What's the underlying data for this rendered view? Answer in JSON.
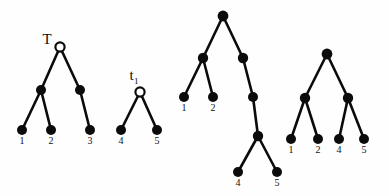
{
  "figure": {
    "background_color": "#fefefe",
    "stroke_color": "#0b0b0b",
    "width": 389,
    "height": 196
  },
  "trees": [
    {
      "id": "tree-T",
      "name": "T",
      "name_subscript": "",
      "name_x": 47,
      "name_y": 44,
      "root_style": "hollow",
      "nodes": [
        {
          "id": "T-root",
          "x": 60,
          "y": 47,
          "style": "hollow",
          "r": 4.6
        },
        {
          "id": "T-int-l",
          "x": 41,
          "y": 90,
          "style": "filled",
          "r": 5.0
        },
        {
          "id": "T-int-r",
          "x": 80,
          "y": 90,
          "style": "filled",
          "r": 5.0
        },
        {
          "id": "T-leaf-1",
          "x": 22,
          "y": 130,
          "style": "filled",
          "r": 5.0
        },
        {
          "id": "T-leaf-2",
          "x": 51,
          "y": 130,
          "style": "filled",
          "r": 5.0
        },
        {
          "id": "T-leaf-3",
          "x": 90,
          "y": 130,
          "style": "filled",
          "r": 5.0
        }
      ],
      "edges": [
        {
          "from": "T-root",
          "to": "T-int-l"
        },
        {
          "from": "T-root",
          "to": "T-int-r"
        },
        {
          "from": "T-int-l",
          "to": "T-leaf-1"
        },
        {
          "from": "T-int-l",
          "to": "T-leaf-2"
        },
        {
          "from": "T-int-r",
          "to": "T-leaf-3"
        }
      ],
      "leaf_labels": [
        {
          "text": "1",
          "x": 22,
          "y": 144
        },
        {
          "text": "2",
          "x": 51,
          "y": 144
        },
        {
          "text": "3",
          "x": 90,
          "y": 144
        }
      ]
    },
    {
      "id": "tree-t1",
      "name": "t",
      "name_subscript": "1",
      "name_x": 134,
      "name_y": 80,
      "root_style": "hollow",
      "nodes": [
        {
          "id": "t1-root",
          "x": 140,
          "y": 92,
          "style": "hollow",
          "r": 4.6
        },
        {
          "id": "t1-leaf-4",
          "x": 121,
          "y": 130,
          "style": "filled",
          "r": 5.0
        },
        {
          "id": "t1-leaf-5",
          "x": 157,
          "y": 130,
          "style": "filled",
          "r": 5.0
        }
      ],
      "edges": [
        {
          "from": "t1-root",
          "to": "t1-leaf-4"
        },
        {
          "from": "t1-root",
          "to": "t1-leaf-5"
        }
      ],
      "leaf_labels": [
        {
          "text": "4",
          "x": 121,
          "y": 144
        },
        {
          "text": "5",
          "x": 157,
          "y": 144
        }
      ]
    },
    {
      "id": "tree-3",
      "name": "",
      "name_subscript": "",
      "name_x": 0,
      "name_y": 0,
      "root_style": "filled",
      "nodes": [
        {
          "id": "t3-root",
          "x": 223,
          "y": 16,
          "style": "filled",
          "r": 5.4
        },
        {
          "id": "t3-int-l",
          "x": 203,
          "y": 58,
          "style": "filled",
          "r": 5.2
        },
        {
          "id": "t3-int-r",
          "x": 243,
          "y": 58,
          "style": "filled",
          "r": 5.2
        },
        {
          "id": "t3-leaf-1",
          "x": 184,
          "y": 97,
          "style": "filled",
          "r": 5.0
        },
        {
          "id": "t3-leaf-2",
          "x": 213,
          "y": 97,
          "style": "filled",
          "r": 5.0
        },
        {
          "id": "t3-chain-a",
          "x": 253,
          "y": 97,
          "style": "filled",
          "r": 5.0
        },
        {
          "id": "t3-chain-b",
          "x": 258,
          "y": 136,
          "style": "filled",
          "r": 5.2
        },
        {
          "id": "t3-leaf-4",
          "x": 238,
          "y": 172,
          "style": "filled",
          "r": 5.0
        },
        {
          "id": "t3-leaf-5",
          "x": 277,
          "y": 172,
          "style": "filled",
          "r": 5.0
        }
      ],
      "edges": [
        {
          "from": "t3-root",
          "to": "t3-int-l"
        },
        {
          "from": "t3-root",
          "to": "t3-int-r"
        },
        {
          "from": "t3-int-l",
          "to": "t3-leaf-1"
        },
        {
          "from": "t3-int-l",
          "to": "t3-leaf-2"
        },
        {
          "from": "t3-int-r",
          "to": "t3-chain-a"
        },
        {
          "from": "t3-chain-a",
          "to": "t3-chain-b"
        },
        {
          "from": "t3-chain-b",
          "to": "t3-leaf-4"
        },
        {
          "from": "t3-chain-b",
          "to": "t3-leaf-5"
        }
      ],
      "leaf_labels": [
        {
          "text": "1",
          "x": 184,
          "y": 111
        },
        {
          "text": "2",
          "x": 213,
          "y": 111
        },
        {
          "text": "4",
          "x": 238,
          "y": 186
        },
        {
          "text": "5",
          "x": 277,
          "y": 186
        }
      ]
    },
    {
      "id": "tree-4",
      "name": "",
      "name_subscript": "",
      "name_x": 0,
      "name_y": 0,
      "root_style": "filled",
      "nodes": [
        {
          "id": "t4-root",
          "x": 327,
          "y": 54,
          "style": "filled",
          "r": 5.4
        },
        {
          "id": "t4-int-l",
          "x": 305,
          "y": 98,
          "style": "filled",
          "r": 5.2
        },
        {
          "id": "t4-int-r",
          "x": 348,
          "y": 98,
          "style": "filled",
          "r": 5.2
        },
        {
          "id": "t4-leaf-1",
          "x": 291,
          "y": 139,
          "style": "filled",
          "r": 5.0
        },
        {
          "id": "t4-leaf-2",
          "x": 318,
          "y": 139,
          "style": "filled",
          "r": 5.0
        },
        {
          "id": "t4-leaf-4",
          "x": 339,
          "y": 139,
          "style": "filled",
          "r": 5.0
        },
        {
          "id": "t4-leaf-5",
          "x": 364,
          "y": 139,
          "style": "filled",
          "r": 5.0
        }
      ],
      "edges": [
        {
          "from": "t4-root",
          "to": "t4-int-l"
        },
        {
          "from": "t4-root",
          "to": "t4-int-r"
        },
        {
          "from": "t4-int-l",
          "to": "t4-leaf-1"
        },
        {
          "from": "t4-int-l",
          "to": "t4-leaf-2"
        },
        {
          "from": "t4-int-r",
          "to": "t4-leaf-4"
        },
        {
          "from": "t4-int-r",
          "to": "t4-leaf-5"
        }
      ],
      "leaf_labels": [
        {
          "text": "1",
          "x": 291,
          "y": 153
        },
        {
          "text": "2",
          "x": 318,
          "y": 153
        },
        {
          "text": "4",
          "x": 339,
          "y": 153
        },
        {
          "text": "5",
          "x": 364,
          "y": 153
        }
      ]
    }
  ]
}
